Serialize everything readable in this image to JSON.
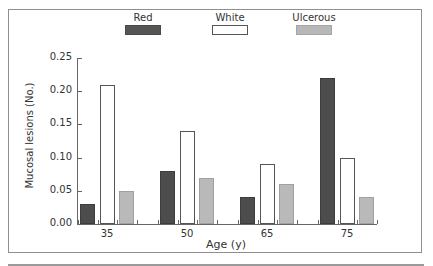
{
  "chart_data": {
    "type": "bar",
    "title": "",
    "xlabel": "Age (y)",
    "ylabel": "Mucosal lesions (No.)",
    "categories": [
      "35",
      "50",
      "65",
      "75"
    ],
    "series": [
      {
        "name": "Red",
        "color": "#4d4d4d",
        "values": [
          0.03,
          0.08,
          0.04,
          0.22
        ]
      },
      {
        "name": "White",
        "color": "#ffffff",
        "values": [
          0.21,
          0.14,
          0.09,
          0.1
        ]
      },
      {
        "name": "Ulcerous",
        "color": "#b9b9b9",
        "values": [
          0.05,
          0.07,
          0.06,
          0.04
        ]
      }
    ],
    "ylim": [
      0,
      0.25
    ],
    "yticks": [
      "0.00",
      "0.05",
      "0.10",
      "0.15",
      "0.20",
      "0.25"
    ],
    "grid": false,
    "legend_position": "top"
  },
  "legend": [
    {
      "label": "Red"
    },
    {
      "label": "White"
    },
    {
      "label": "Ulcerous"
    }
  ]
}
